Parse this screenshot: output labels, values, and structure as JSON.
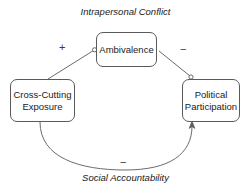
{
  "diagram": {
    "title_top": "Intrapersonal Conflict",
    "title_bottom": "Social Accountability",
    "background_color": "#ffffff",
    "stroke_color": "#5a5a5a",
    "text_color": "#1a1a1a",
    "nodes": [
      {
        "id": "ambivalence",
        "label": "Ambivalence",
        "x": 96,
        "y": 32,
        "width": 61,
        "height": 35
      },
      {
        "id": "cross-cutting-exposure",
        "label": "Cross-Cutting\nExposure",
        "x": 10,
        "y": 79,
        "width": 65,
        "height": 43
      },
      {
        "id": "political-participation",
        "label": "Political\nParticipation",
        "x": 182,
        "y": 79,
        "width": 58,
        "height": 43
      }
    ],
    "edges": [
      {
        "id": "exposure-to-ambivalence",
        "from": "cross-cutting-exposure",
        "to": "ambivalence",
        "sign": "+",
        "pathway": "Intrapersonal Conflict",
        "endpoint": "circle"
      },
      {
        "id": "ambivalence-to-participation",
        "from": "ambivalence",
        "to": "political-participation",
        "sign": "−",
        "pathway": "Intrapersonal Conflict",
        "endpoint": "circle"
      },
      {
        "id": "exposure-to-participation",
        "from": "cross-cutting-exposure",
        "to": "political-participation",
        "sign": "−",
        "pathway": "Social Accountability",
        "endpoint": "arrow"
      }
    ],
    "signs": {
      "plus_exposure_ambivalence": "+",
      "minus_ambivalence_participation": "−",
      "minus_exposure_participation": "−"
    }
  }
}
